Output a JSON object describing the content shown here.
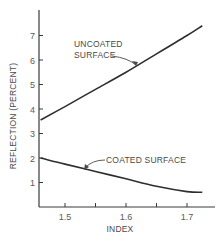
{
  "chart_data": {
    "type": "line",
    "title": "",
    "xlabel": "INDEX",
    "ylabel": "REFLECTION (PERCENT)",
    "xlim": [
      1.457,
      1.74
    ],
    "ylim": [
      0,
      8
    ],
    "x_ticks": [
      1.5,
      1.55,
      1.6,
      1.65,
      1.7
    ],
    "x_tick_labels": [
      "1.5",
      "",
      "1.6",
      "",
      "1.7"
    ],
    "y_ticks": [
      1,
      2,
      3,
      4,
      5,
      6,
      7
    ],
    "y_tick_labels": [
      "1",
      "2",
      "3",
      "4",
      "5",
      "6",
      "7"
    ],
    "grid": false,
    "legend": "none (direct curve annotations with arrows)",
    "series": [
      {
        "name": "UNCOATED SURFACE",
        "x": [
          1.46,
          1.5,
          1.55,
          1.6,
          1.65,
          1.7,
          1.725
        ],
        "values": [
          3.55,
          4.1,
          4.8,
          5.5,
          6.25,
          7.0,
          7.4
        ]
      },
      {
        "name": "COATED SURFACE",
        "x": [
          1.46,
          1.5,
          1.55,
          1.6,
          1.65,
          1.7,
          1.725
        ],
        "values": [
          2.0,
          1.75,
          1.45,
          1.15,
          0.85,
          0.63,
          0.6
        ]
      }
    ],
    "annotations": [
      {
        "text": [
          "UNCOATED",
          "SURFACE"
        ],
        "points_to": "UNCOATED SURFACE"
      },
      {
        "text": [
          "COATED SURFACE"
        ],
        "points_to": "COATED SURFACE"
      }
    ]
  },
  "labels": {
    "xlabel": "INDEX",
    "ylabel": "REFLECTION (PERCENT)",
    "uncoated_line1": "UNCOATED",
    "uncoated_line2": "SURFACE",
    "coated": "COATED SURFACE"
  },
  "colors": {
    "line": "#2e2e2e",
    "text": "#4a4a4a",
    "background": "#ffffff"
  }
}
